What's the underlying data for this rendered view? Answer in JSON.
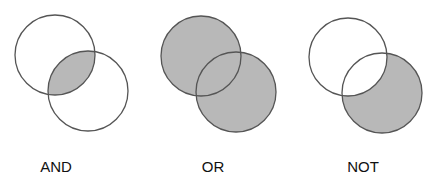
{
  "colors": {
    "fill": "#b8b8b8",
    "stroke": "#555555",
    "background": "#ffffff"
  },
  "diagrams": [
    {
      "label": "AND",
      "operation": "intersection",
      "label_x": 56
    },
    {
      "label": "OR",
      "operation": "union",
      "label_x": 213
    },
    {
      "label": "NOT",
      "operation": "difference (B not A)",
      "label_x": 363
    }
  ]
}
